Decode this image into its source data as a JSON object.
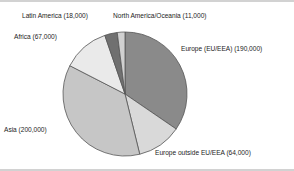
{
  "chart_data": {
    "type": "pie",
    "title": "",
    "subtitle": "",
    "xlabel": "",
    "ylabel": "",
    "legend_position": "none",
    "grid": false,
    "total": 550000,
    "units": "people",
    "start_angle_deg": 0,
    "direction": "clockwise",
    "categories": [
      "Europe (EU/EEA)",
      "Europe outside EU/EEA",
      "Asia",
      "Africa",
      "Latin America",
      "North America/Oceania"
    ],
    "values": [
      190000,
      64000,
      200000,
      67000,
      18000,
      11000
    ],
    "slices": [
      {
        "name": "Europe (EU/EEA)",
        "value": 190000,
        "value_text": "190,000",
        "label": "Europe (EU/EEA) (190,000)",
        "color": "#8a8a8a",
        "percent": 34.5,
        "start_deg": 0,
        "sweep_deg": 124.4
      },
      {
        "name": "Europe outside EU/EEA",
        "value": 64000,
        "value_text": "64,000",
        "label": "Europe outside EU/EEA (64,000)",
        "color": "#d9d9d9",
        "percent": 11.6,
        "start_deg": 124.4,
        "sweep_deg": 41.9
      },
      {
        "name": "Asia",
        "value": 200000,
        "value_text": "200,000",
        "label": "Asia (200,000)",
        "color": "#c6c6c6",
        "percent": 36.4,
        "start_deg": 166.3,
        "sweep_deg": 130.9
      },
      {
        "name": "Africa",
        "value": 67000,
        "value_text": "67,000",
        "label": "Africa (67,000)",
        "color": "#eaeaea",
        "percent": 12.2,
        "start_deg": 297.2,
        "sweep_deg": 43.9
      },
      {
        "name": "Latin America",
        "value": 18000,
        "value_text": "18,000",
        "label": "Latin America (18,000)",
        "color": "#707070",
        "percent": 3.3,
        "start_deg": 341.1,
        "sweep_deg": 11.8
      },
      {
        "name": "North America/Oceania",
        "value": 11000,
        "value_text": "11,000",
        "label": "North America/Oceania (11,000)",
        "color": "#d0d0d0",
        "percent": 2.0,
        "start_deg": 352.9,
        "sweep_deg": 7.1
      }
    ],
    "colors": {
      "europe_eu": "#8a8a8a",
      "europe_outside": "#d9d9d9",
      "asia": "#c6c6c6",
      "africa": "#eaeaea",
      "latin_america": "#707070",
      "north_america_oceania": "#d0d0d0",
      "slice_outline": "#555555",
      "background": "#ffffff",
      "rule": "#d2d2d2",
      "text": "#1d1d1d"
    }
  }
}
